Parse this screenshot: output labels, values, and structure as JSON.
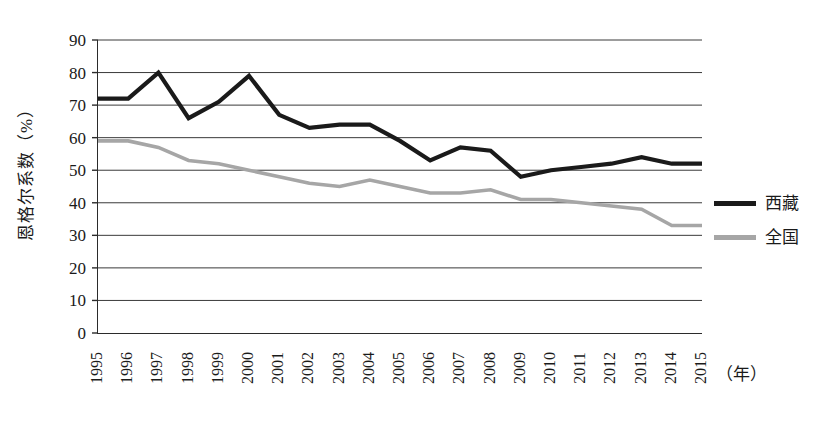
{
  "chart_data": {
    "type": "line",
    "title": "",
    "xlabel": "（年）",
    "ylabel": "恩格尔系数（%）",
    "x": [
      1995,
      1996,
      1997,
      1998,
      1999,
      2000,
      2001,
      2002,
      2003,
      2004,
      2005,
      2006,
      2007,
      2008,
      2009,
      2010,
      2011,
      2012,
      2013,
      2014,
      2015
    ],
    "categories": [
      "1995",
      "1996",
      "1997",
      "1998",
      "1999",
      "2000",
      "2001",
      "2002",
      "2003",
      "2004",
      "2005",
      "2006",
      "2007",
      "2008",
      "2009",
      "2010",
      "2011",
      "2012",
      "2013",
      "2014",
      "2015"
    ],
    "series": [
      {
        "name": "西藏",
        "color": "#1a1a1a",
        "values": [
          72,
          72,
          80,
          66,
          71,
          79,
          67,
          63,
          64,
          64,
          59,
          53,
          57,
          56,
          48,
          50,
          51,
          52,
          54,
          52,
          52
        ]
      },
      {
        "name": "全国",
        "color": "#a6a6a6",
        "values": [
          59,
          59,
          57,
          53,
          52,
          50,
          48,
          46,
          45,
          47,
          45,
          43,
          43,
          44,
          41,
          41,
          40,
          39,
          38,
          33,
          33
        ]
      }
    ],
    "ylim": [
      0,
      90
    ],
    "yticks": [
      0,
      10,
      20,
      30,
      40,
      50,
      60,
      70,
      80,
      90
    ],
    "grid": "horizontal",
    "legend_position": "right"
  },
  "axes": {
    "y_title": "恩格尔系数（%）",
    "x_unit": "（年）"
  },
  "legend": {
    "entries": [
      {
        "label": "西藏",
        "color": "#1a1a1a"
      },
      {
        "label": "全国",
        "color": "#a6a6a6"
      }
    ]
  }
}
